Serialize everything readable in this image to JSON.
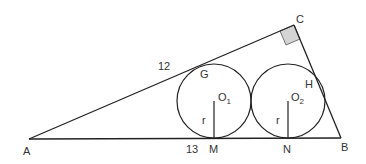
{
  "diagram": {
    "type": "geometry",
    "colors": {
      "stroke": "#222222",
      "right_angle_fill": "#d4d4d4",
      "text": "#333333"
    },
    "points": {
      "A": {
        "label": "A",
        "x": 29,
        "y": 139
      },
      "B": {
        "label": "B",
        "x": 341,
        "y": 138
      },
      "C": {
        "label": "C",
        "x": 294,
        "y": 25
      },
      "G": {
        "label": "G"
      },
      "H": {
        "label": "H"
      },
      "M": {
        "label": "M"
      },
      "N": {
        "label": "N"
      }
    },
    "circles": [
      {
        "center_label": "O",
        "center_sub": "1",
        "cx": 214,
        "cy": 101,
        "r": 37,
        "radius_label": "r"
      },
      {
        "center_label": "O",
        "center_sub": "2",
        "cx": 288,
        "cy": 101,
        "r": 37,
        "radius_label": "r"
      }
    ],
    "lengths": {
      "AG": "12",
      "AM": "13"
    }
  }
}
